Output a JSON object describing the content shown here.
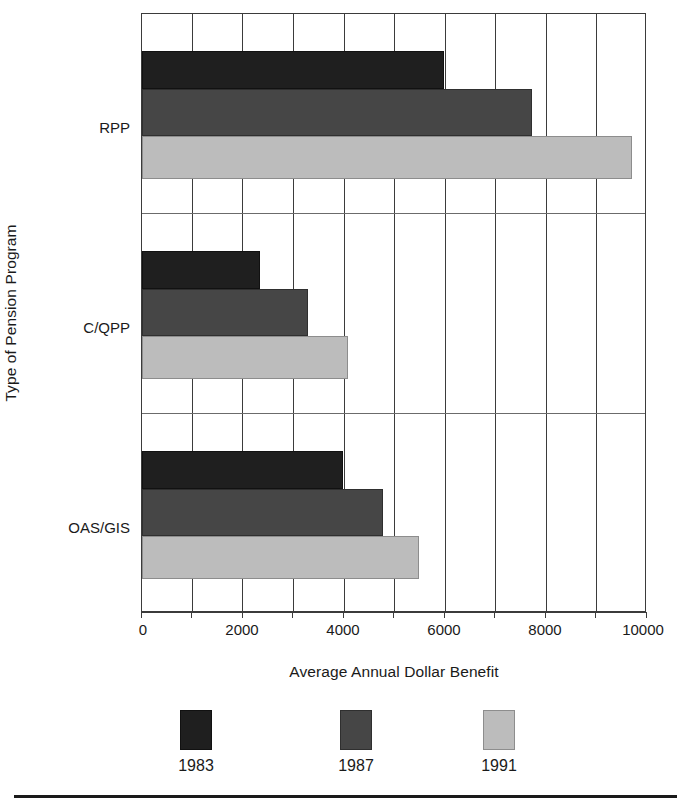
{
  "chart_data": {
    "type": "bar",
    "orientation": "horizontal",
    "title": "",
    "xlabel": "Average Annual Dollar Benefit",
    "ylabel": "Type of Pension Program",
    "categories": [
      "RPP",
      "C/QPP",
      "OAS/GIS"
    ],
    "series": [
      {
        "name": "1983",
        "color": "#1f1f1f",
        "values": [
          6000,
          2350,
          4000
        ]
      },
      {
        "name": "1987",
        "color": "#464646",
        "values": [
          7750,
          3300,
          4800
        ]
      },
      {
        "name": "1991",
        "color": "#bcbcbc",
        "values": [
          9750,
          4100,
          5500
        ]
      }
    ],
    "xlim": [
      0,
      10000
    ],
    "xticks": [
      0,
      2000,
      4000,
      6000,
      8000,
      10000
    ],
    "xtick_labels": [
      "0",
      "2000",
      "4000",
      "6000",
      "8000",
      "10000"
    ],
    "minor_tick_step": 1000,
    "grid": "vertical gridlines every 1000 units; horizontal separators between category bands",
    "legend_position": "bottom-center",
    "legend_entries": [
      "1983",
      "1987",
      "1991"
    ]
  },
  "axes": {
    "y_title": "Type of Pension Program",
    "x_title": "Average Annual Dollar Benefit",
    "category_labels": [
      "RPP",
      "C/QPP",
      "OAS/GIS"
    ],
    "x_tick_labels": [
      "0",
      "2000",
      "4000",
      "6000",
      "8000",
      "10000"
    ]
  },
  "legend": {
    "items": [
      {
        "label": "1983",
        "swatch": "legend-swatch-1983"
      },
      {
        "label": "1987",
        "swatch": "legend-swatch-1987"
      },
      {
        "label": "1991",
        "swatch": "legend-swatch-1991"
      }
    ]
  }
}
